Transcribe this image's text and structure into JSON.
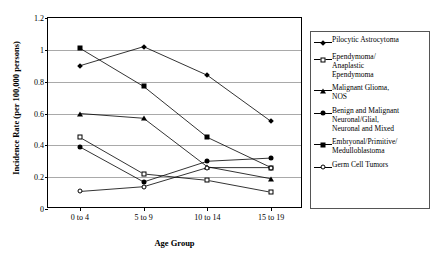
{
  "chart_data": {
    "type": "line",
    "title": "",
    "xlabel": "Age Group",
    "ylabel": "Incidence Rate (per 100,000 persons)",
    "categories": [
      "0 to 4",
      "5 to 9",
      "10 to 14",
      "15 to 19"
    ],
    "ylim": [
      0,
      1.2
    ],
    "ytick_labels": [
      "1.2",
      "1",
      "0.8",
      "0.6",
      "0.4",
      "0.2",
      "0"
    ],
    "ytick_values": [
      1.2,
      1,
      0.8,
      0.6,
      0.4,
      0.2,
      0
    ],
    "grid": "horizontal",
    "legend_position": "right",
    "series": [
      {
        "name": "Pilocytic Astrocytoma",
        "marker": "filled-diamond",
        "values": [
          0.9,
          1.02,
          0.84,
          0.55
        ]
      },
      {
        "name": "Ependymoma/\nAnaplastic\nEpendymoma",
        "marker": "open-square",
        "values": [
          0.45,
          0.22,
          0.18,
          0.105
        ]
      },
      {
        "name": "Malignant Glioma,\nNOS",
        "marker": "filled-triangle",
        "values": [
          0.6,
          0.57,
          0.265,
          0.19
        ]
      },
      {
        "name": "Benign and Malignant\nNeuronal/Glial,\nNeuronal and Mixed",
        "marker": "filled-circle",
        "values": [
          0.39,
          0.17,
          0.3,
          0.32
        ]
      },
      {
        "name": "Embryonal/Primitive/\nMedulloblastoma",
        "marker": "filled-square",
        "values": [
          1.01,
          0.77,
          0.45,
          0.26
        ]
      },
      {
        "name": "Germ Cell Tumors",
        "marker": "open-circle",
        "values": [
          0.11,
          0.14,
          0.26,
          0.26
        ]
      }
    ]
  }
}
